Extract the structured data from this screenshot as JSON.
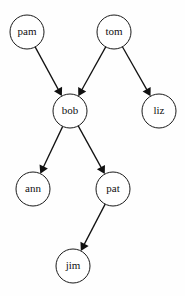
{
  "diagram": {
    "type": "directed-graph",
    "background_color": "#fefefe",
    "node_fill_color": "#ffffff",
    "node_stroke_color": "#1a1a1a",
    "edge_color": "#111111",
    "label_color": "#111111",
    "node_radius": 17,
    "nodes": [
      {
        "id": "pam",
        "label": "pam",
        "cx": 27,
        "cy": 32
      },
      {
        "id": "tom",
        "label": "tom",
        "cx": 114,
        "cy": 32
      },
      {
        "id": "bob",
        "label": "bob",
        "cx": 70,
        "cy": 111
      },
      {
        "id": "liz",
        "label": "liz",
        "cx": 159,
        "cy": 111
      },
      {
        "id": "ann",
        "label": "ann",
        "cx": 33,
        "cy": 189
      },
      {
        "id": "pat",
        "label": "pat",
        "cx": 113,
        "cy": 189
      },
      {
        "id": "jim",
        "label": "jim",
        "cx": 73,
        "cy": 266
      }
    ],
    "edges": [
      {
        "from": "pam",
        "to": "bob",
        "label": ""
      },
      {
        "from": "tom",
        "to": "bob",
        "label": ""
      },
      {
        "from": "tom",
        "to": "liz",
        "label": ""
      },
      {
        "from": "bob",
        "to": "ann",
        "label": ""
      },
      {
        "from": "bob",
        "to": "pat",
        "label": ""
      },
      {
        "from": "pat",
        "to": "jim",
        "label": ""
      }
    ]
  }
}
